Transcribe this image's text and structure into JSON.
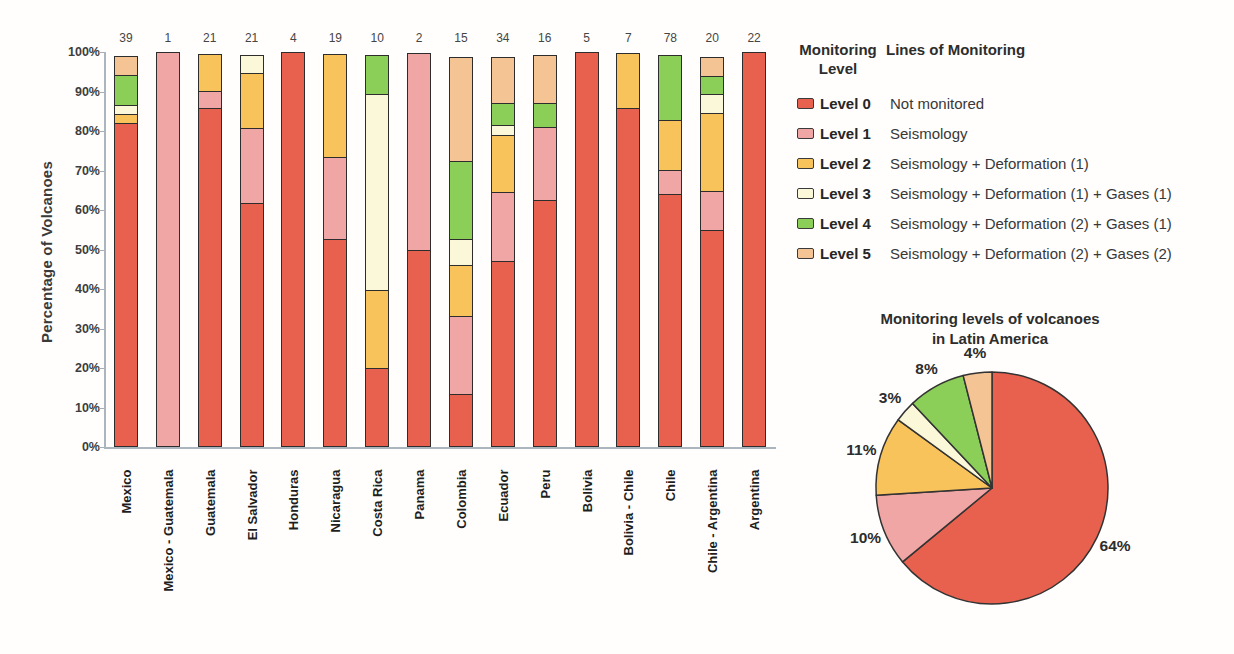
{
  "figure": {
    "bar_chart": {
      "ylabel": "Percentage of Volcanoes"
    },
    "legend": {
      "header_col1_line1": "Monitoring",
      "header_col1_line2": "Level",
      "header_col2": "Lines of Monitoring",
      "items": [
        {
          "level": "Level 0",
          "description": "Not monitored",
          "color": "#E8614E"
        },
        {
          "level": "Level 1",
          "description": "Seismology",
          "color": "#F0A6A4"
        },
        {
          "level": "Level 2",
          "description": "Seismology + Deformation (1)",
          "color": "#F9C35B"
        },
        {
          "level": "Level 3",
          "description": "Seismology + Deformation (1) + Gases (1)",
          "color": "#FBF8D9"
        },
        {
          "level": "Level 4",
          "description": "Seismology + Deformation (2) + Gases (1)",
          "color": "#8BCE58"
        },
        {
          "level": "Level 5",
          "description": "Seismology + Deformation (2) + Gases (2)",
          "color": "#F4C494"
        }
      ]
    },
    "pie_title_line1": "Monitoring levels of volcanoes",
    "pie_title_line2": "in Latin America"
  },
  "chart_data": [
    {
      "type": "bar",
      "subtype": "stacked-100-percent",
      "ylabel": "Percentage of Volcanoes",
      "ylim": [
        0,
        100
      ],
      "ytick_labels": [
        "0%",
        "10%",
        "20%",
        "30%",
        "40%",
        "50%",
        "60%",
        "70%",
        "80%",
        "90%",
        "100%"
      ],
      "grid": false,
      "categories": [
        "Mexico",
        "Mexico - Guatemala",
        "Guatemala",
        "El Salvador",
        "Honduras",
        "Nicaragua",
        "Costa Rica",
        "Panama",
        "Colombia",
        "Ecuador",
        "Peru",
        "Bolivia",
        "Bolivia - Chile",
        "Chile",
        "Chile - Argentina",
        "Argentina"
      ],
      "totals_above_bars": [
        39,
        1,
        21,
        21,
        4,
        19,
        10,
        2,
        15,
        34,
        16,
        5,
        7,
        78,
        20,
        22
      ],
      "series": [
        {
          "name": "Level 0",
          "color": "#E8614E",
          "counts": [
            32,
            0,
            18,
            13,
            4,
            10,
            2,
            1,
            2,
            16,
            10,
            5,
            6,
            50,
            11,
            22
          ]
        },
        {
          "name": "Level 1",
          "color": "#F0A6A4",
          "counts": [
            0,
            1,
            1,
            4,
            0,
            4,
            0,
            1,
            3,
            6,
            3,
            0,
            0,
            5,
            2,
            0
          ]
        },
        {
          "name": "Level 2",
          "color": "#F9C35B",
          "counts": [
            1,
            0,
            2,
            3,
            0,
            5,
            2,
            0,
            2,
            5,
            0,
            0,
            1,
            10,
            4,
            0
          ]
        },
        {
          "name": "Level 3",
          "color": "#FBF8D9",
          "counts": [
            1,
            0,
            0,
            1,
            0,
            0,
            5,
            0,
            1,
            1,
            0,
            0,
            0,
            0,
            1,
            0
          ]
        },
        {
          "name": "Level 4",
          "color": "#8BCE58",
          "counts": [
            3,
            0,
            0,
            0,
            0,
            0,
            1,
            0,
            3,
            2,
            1,
            0,
            0,
            13,
            1,
            0
          ]
        },
        {
          "name": "Level 5",
          "color": "#F4C494",
          "counts": [
            2,
            0,
            0,
            0,
            0,
            0,
            0,
            0,
            4,
            4,
            2,
            0,
            0,
            0,
            1,
            0
          ]
        }
      ]
    },
    {
      "type": "pie",
      "title": "Monitoring levels of volcanoes in Latin America",
      "labels": [
        "Level 0",
        "Level 1",
        "Level 2",
        "Level 3",
        "Level 4",
        "Level 5"
      ],
      "values": [
        64,
        10,
        11,
        3,
        8,
        4
      ],
      "unit": "%",
      "colors": [
        "#E8614E",
        "#F0A6A4",
        "#F9C35B",
        "#FBF8D9",
        "#8BCE58",
        "#F4C494"
      ],
      "start_angle_deg": 0,
      "direction": "clockwise",
      "legend_position": "none"
    }
  ]
}
